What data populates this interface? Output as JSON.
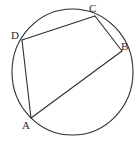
{
  "figure": {
    "kind": "geometry-diagram",
    "background_color": "#ffffff",
    "stroke_color": "#2f2f2f",
    "label_color": "#2b2b2b",
    "canvas": {
      "width": 139,
      "height": 142
    }
  },
  "circle": {
    "name": "circumscribed-circle",
    "center_x": 72.5,
    "center_y": 72,
    "radius_x": 60.5,
    "radius_y": 63,
    "stroke_width": 1.1
  },
  "points": [
    {
      "id": "A",
      "label": "A",
      "x": 31,
      "y": 118
    },
    {
      "id": "B",
      "label": "B",
      "x": 122,
      "y": 51
    },
    {
      "id": "C",
      "label": "C",
      "x": 95,
      "y": 16
    },
    {
      "id": "D",
      "label": "D",
      "x": 22,
      "y": 40
    }
  ],
  "segments": [
    {
      "id": "DC",
      "from": "D",
      "to": "C",
      "x1": 22,
      "y1": 40,
      "x2": 95,
      "y2": 16
    },
    {
      "id": "CB",
      "from": "C",
      "to": "B",
      "x1": 95,
      "y1": 16,
      "x2": 122,
      "y2": 51
    },
    {
      "id": "DA",
      "from": "D",
      "to": "A",
      "x1": 22,
      "y1": 40,
      "x2": 31,
      "y2": 118
    },
    {
      "id": "AB",
      "from": "A",
      "to": "B",
      "x1": 31,
      "y1": 118,
      "x2": 122,
      "y2": 51
    }
  ],
  "labels": {
    "A": "A",
    "B": "B",
    "C": "C",
    "D": "D"
  }
}
